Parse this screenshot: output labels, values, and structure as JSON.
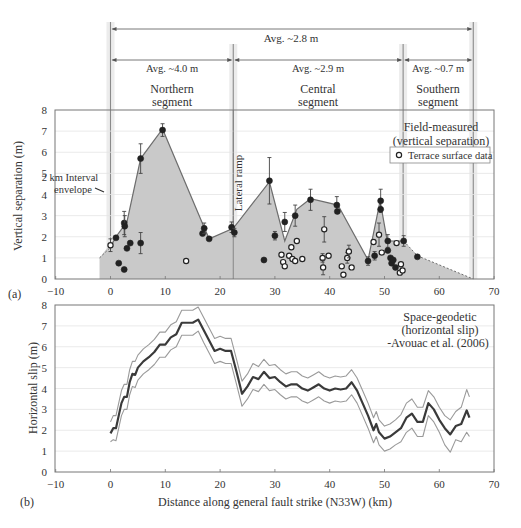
{
  "chart_data": [
    {
      "panel": "(a)",
      "type": "scatter",
      "title": "Field-measured (vertical separation)",
      "title_lines": [
        "Field-measured",
        "(vertical separation)"
      ],
      "xlabel": "",
      "ylabel": "Vertical separation (m)",
      "xlim": [
        -10,
        70
      ],
      "ylim": [
        0,
        8
      ],
      "xticks": [
        -10,
        0,
        10,
        20,
        30,
        40,
        50,
        60,
        70
      ],
      "yticks": [
        0,
        1,
        2,
        3,
        4,
        5,
        6,
        7,
        8
      ],
      "grid": true,
      "legend": [
        {
          "label": "Terrace surface data",
          "marker": "open-circle"
        }
      ],
      "annotations": {
        "envelope_label": [
          "2 km Interval",
          "envelope"
        ],
        "lateral_ramp": "Lateral ramp",
        "lateral_ramp_x": 22.4
      },
      "segment_boundaries_km": [
        0,
        22.4,
        53.4,
        66.2
      ],
      "segments": [
        {
          "name_lines": [
            "Northern",
            "segment"
          ],
          "avg": "Avg. ~4.0 m",
          "from": 0,
          "to": 22.4
        },
        {
          "name_lines": [
            "Central",
            "segment"
          ],
          "avg": "Avg. ~2.9 m",
          "from": 22.4,
          "to": 53.4
        },
        {
          "name_lines": [
            "Southern",
            "segment"
          ],
          "avg": "Avg. ~0.7 m",
          "from": 53.4,
          "to": 66.2
        }
      ],
      "overall": {
        "avg": "Avg. ~2.8 m",
        "from": 0,
        "to": 66.2
      },
      "envelope": {
        "x": [
          -2,
          1,
          3,
          5.5,
          9.5,
          17,
          18,
          22.4,
          29,
          31.8,
          34,
          36.5,
          41.5,
          47,
          49.2,
          50.5,
          51,
          53.5,
          56,
          66.2
        ],
        "y": [
          1.0,
          2.0,
          2.7,
          5.7,
          7.1,
          2.5,
          1.9,
          2.4,
          4.6,
          1.8,
          3.3,
          3.8,
          3.5,
          0.9,
          3.7,
          1.8,
          1.8,
          1.8,
          1.1,
          0.0
        ],
        "dashed_from_x": 53.5,
        "dashed_to_x_start": 0
      },
      "series": [
        {
          "name": "Field measurement (filled)",
          "marker": "filled-circle",
          "points": [
            {
              "x": 1.0,
              "y": 1.95,
              "err": 0
            },
            {
              "x": 1.5,
              "y": 0.75,
              "err": 0
            },
            {
              "x": 2.5,
              "y": 0.45,
              "err": 0
            },
            {
              "x": 2.5,
              "y": 2.65,
              "err": 0.55
            },
            {
              "x": 2.6,
              "y": 2.5,
              "err": 0.5
            },
            {
              "x": 3.0,
              "y": 1.45,
              "err": 0
            },
            {
              "x": 3.6,
              "y": 1.7,
              "err": 0
            },
            {
              "x": 5.5,
              "y": 1.7,
              "err": 0.5
            },
            {
              "x": 5.5,
              "y": 5.7,
              "err": 0.7
            },
            {
              "x": 9.5,
              "y": 7.05,
              "err": 0.3
            },
            {
              "x": 16.8,
              "y": 2.15,
              "err": 0
            },
            {
              "x": 17.1,
              "y": 2.4,
              "err": 0.25
            },
            {
              "x": 18.0,
              "y": 1.9,
              "err": 0
            },
            {
              "x": 22.1,
              "y": 2.45,
              "err": 0.25
            },
            {
              "x": 22.6,
              "y": 2.2,
              "err": 0.2
            },
            {
              "x": 28.0,
              "y": 0.9,
              "err": 0
            },
            {
              "x": 29.0,
              "y": 4.65,
              "err": 1.1
            },
            {
              "x": 30.0,
              "y": 2.05,
              "err": 0.2
            },
            {
              "x": 31.8,
              "y": 2.7,
              "err": 0.45
            },
            {
              "x": 33.7,
              "y": 3.0,
              "err": 0.5
            },
            {
              "x": 36.5,
              "y": 3.75,
              "err": 0.5
            },
            {
              "x": 41.3,
              "y": 3.5,
              "err": 0.4
            },
            {
              "x": 41.4,
              "y": 3.2,
              "err": 0
            },
            {
              "x": 47.0,
              "y": 0.85,
              "err": 0.2
            },
            {
              "x": 48.2,
              "y": 1.1,
              "err": 0.2
            },
            {
              "x": 49.3,
              "y": 3.7,
              "err": 0.55
            },
            {
              "x": 49.3,
              "y": 3.3,
              "err": 0
            },
            {
              "x": 50.6,
              "y": 1.8,
              "err": 0.3
            },
            {
              "x": 50.6,
              "y": 1.35,
              "err": 0
            },
            {
              "x": 51.1,
              "y": 1.0,
              "err": 0
            },
            {
              "x": 51.3,
              "y": 0.75,
              "err": 0
            },
            {
              "x": 51.6,
              "y": 0.9,
              "err": 0
            },
            {
              "x": 52.0,
              "y": 0.55,
              "err": 0
            },
            {
              "x": 53.5,
              "y": 1.8,
              "err": 0.25
            },
            {
              "x": 56.0,
              "y": 1.05,
              "err": 0
            }
          ]
        },
        {
          "name": "Terrace surface data",
          "marker": "open-circle",
          "points": [
            {
              "x": 0.0,
              "y": 1.6,
              "err": 0.3
            },
            {
              "x": 13.8,
              "y": 0.85,
              "err": 0
            },
            {
              "x": 31.2,
              "y": 1.15,
              "err": 0
            },
            {
              "x": 31.5,
              "y": 0.8,
              "err": 0
            },
            {
              "x": 31.8,
              "y": 0.6,
              "err": 0
            },
            {
              "x": 32.6,
              "y": 1.1,
              "err": 0
            },
            {
              "x": 33.0,
              "y": 1.5,
              "err": 0
            },
            {
              "x": 33.2,
              "y": 0.95,
              "err": 0
            },
            {
              "x": 33.7,
              "y": 0.85,
              "err": 0
            },
            {
              "x": 34.0,
              "y": 1.8,
              "err": 0
            },
            {
              "x": 35.0,
              "y": 0.95,
              "err": 0
            },
            {
              "x": 38.7,
              "y": 1.0,
              "err": 0.2
            },
            {
              "x": 38.8,
              "y": 0.55,
              "err": 0.35
            },
            {
              "x": 39.0,
              "y": 2.35,
              "err": 0.6
            },
            {
              "x": 39.8,
              "y": 1.1,
              "err": 0
            },
            {
              "x": 42.2,
              "y": 0.6,
              "err": 0
            },
            {
              "x": 42.5,
              "y": 0.2,
              "err": 0
            },
            {
              "x": 43.2,
              "y": 1.0,
              "err": 0.25
            },
            {
              "x": 43.5,
              "y": 1.3,
              "err": 0.3
            },
            {
              "x": 44.0,
              "y": 0.55,
              "err": 0
            },
            {
              "x": 48.0,
              "y": 1.75,
              "err": 0
            },
            {
              "x": 49.0,
              "y": 2.1,
              "err": 0.55
            },
            {
              "x": 49.5,
              "y": 1.25,
              "err": 0
            },
            {
              "x": 52.2,
              "y": 1.7,
              "err": 0
            },
            {
              "x": 52.8,
              "y": 0.3,
              "err": 0
            },
            {
              "x": 53.0,
              "y": 0.7,
              "err": 0
            },
            {
              "x": 53.3,
              "y": 0.4,
              "err": 0
            }
          ]
        }
      ]
    },
    {
      "panel": "(b)",
      "type": "line",
      "title": "Space-geodetic (horizontal slip) -Avouac et al. (2006)",
      "title_lines": [
        "Space-geodetic",
        "(horizontal slip)",
        "-Avouac et al. (2006)"
      ],
      "xlabel": "Distance along general fault strike (N33W) (km)",
      "ylabel": "Horizontal slip (m)",
      "xlim": [
        -10,
        70
      ],
      "ylim": [
        0,
        8
      ],
      "xticks": [
        -10,
        0,
        10,
        20,
        30,
        40,
        50,
        60,
        70
      ],
      "yticks": [
        0,
        1,
        2,
        3,
        4,
        5,
        6,
        7,
        8
      ],
      "grid": true,
      "x": [
        0,
        0.5,
        1,
        1.5,
        2,
        2.5,
        3,
        3.5,
        4,
        4.5,
        5,
        6,
        7,
        8,
        9,
        9.5,
        10,
        11,
        12,
        13,
        14,
        15,
        16,
        17,
        18,
        19,
        20,
        21,
        22,
        23,
        24,
        25,
        26,
        27,
        28,
        29,
        30,
        31,
        32,
        33,
        34,
        35,
        36,
        37,
        38,
        39,
        40,
        41,
        42,
        43,
        44,
        45,
        46,
        47,
        48,
        48.5,
        49,
        50,
        51,
        52,
        53,
        54,
        55,
        56,
        57,
        58,
        59,
        60,
        61,
        62,
        63,
        64,
        65,
        65.5
      ],
      "series": [
        {
          "name": "Horizontal slip (mean)",
          "values": [
            1.85,
            2.1,
            2.1,
            2.7,
            3.3,
            3.6,
            3.6,
            4.3,
            4.7,
            4.65,
            5.0,
            5.3,
            5.5,
            5.75,
            6.1,
            6.1,
            6.1,
            6.45,
            6.6,
            7.15,
            7.15,
            7.15,
            7.3,
            6.8,
            6.3,
            5.8,
            5.9,
            5.8,
            5.8,
            4.8,
            3.75,
            4.1,
            4.55,
            4.45,
            4.8,
            4.5,
            4.55,
            4.3,
            4.1,
            4.2,
            4.2,
            4.0,
            3.9,
            4.05,
            4.2,
            4.0,
            3.9,
            4.0,
            3.95,
            4.0,
            4.3,
            3.9,
            3.3,
            2.7,
            2.0,
            2.3,
            1.9,
            1.6,
            1.7,
            1.9,
            2.1,
            2.6,
            2.8,
            2.4,
            2.4,
            3.3,
            3.0,
            2.5,
            2.1,
            1.8,
            2.2,
            2.3,
            2.95,
            2.6
          ]
        },
        {
          "name": "Upper bound",
          "values": [
            2.4,
            2.7,
            2.7,
            3.3,
            3.9,
            4.2,
            4.2,
            4.9,
            5.3,
            5.3,
            5.6,
            5.9,
            6.1,
            6.35,
            6.7,
            6.7,
            6.7,
            7.05,
            7.2,
            7.75,
            7.75,
            7.75,
            7.9,
            7.4,
            6.9,
            6.4,
            6.5,
            6.4,
            6.4,
            5.4,
            4.35,
            4.7,
            5.2,
            5.05,
            5.4,
            5.1,
            5.15,
            4.9,
            4.7,
            4.8,
            4.8,
            4.6,
            4.5,
            4.65,
            4.8,
            4.6,
            4.5,
            4.6,
            4.55,
            4.6,
            4.9,
            4.5,
            3.9,
            3.3,
            2.6,
            2.9,
            2.5,
            2.2,
            2.3,
            2.5,
            2.75,
            3.3,
            3.5,
            3.1,
            3.1,
            3.9,
            3.6,
            3.1,
            2.7,
            2.5,
            2.9,
            3.1,
            3.95,
            3.6
          ]
        },
        {
          "name": "Lower bound",
          "values": [
            1.45,
            1.55,
            1.5,
            2.1,
            2.7,
            3.0,
            3.0,
            3.7,
            4.1,
            4.05,
            4.4,
            4.7,
            4.9,
            5.15,
            5.5,
            5.5,
            5.5,
            5.85,
            6.0,
            6.55,
            6.55,
            6.55,
            6.75,
            6.2,
            5.7,
            5.2,
            5.3,
            5.2,
            5.2,
            4.2,
            3.15,
            3.5,
            3.95,
            3.85,
            4.2,
            3.9,
            3.95,
            3.7,
            3.5,
            3.6,
            3.6,
            3.4,
            3.3,
            3.45,
            3.6,
            3.4,
            3.3,
            3.4,
            3.35,
            3.4,
            3.7,
            3.3,
            2.7,
            2.1,
            1.4,
            1.7,
            1.3,
            1.0,
            1.1,
            1.3,
            1.45,
            1.9,
            2.1,
            1.7,
            1.7,
            2.7,
            2.4,
            1.9,
            1.3,
            0.95,
            1.55,
            1.45,
            1.9,
            1.7
          ]
        }
      ]
    }
  ],
  "layout": {
    "xpx": {
      "x0": 110.5,
      "pxPerKm": 5.48
    },
    "panelA": {
      "top": 110,
      "bottom": 279,
      "left": 55,
      "right": 494
    },
    "panelB": {
      "top": 305,
      "bottom": 472,
      "left": 55,
      "right": 494
    },
    "colors": {
      "envelope_fill": "#c9c9c9",
      "envelope_line": "#6d6d6d",
      "marker": "#222222",
      "axis": "#777777",
      "grid": "#e4e4e4",
      "mean_line": "#3a3a3a",
      "bound_line": "#9a9a9a",
      "boundary": "#8a8a8a"
    }
  }
}
